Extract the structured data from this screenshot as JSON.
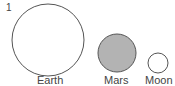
{
  "figure": {
    "number": "1",
    "bodies": [
      {
        "label": "Earth",
        "fill": "#ffffff",
        "stroke": "#555555"
      },
      {
        "label": "Mars",
        "fill": "#b3b3b3",
        "stroke": "#555555"
      },
      {
        "label": "Moon",
        "fill": "#ffffff",
        "stroke": "#555555"
      }
    ]
  }
}
